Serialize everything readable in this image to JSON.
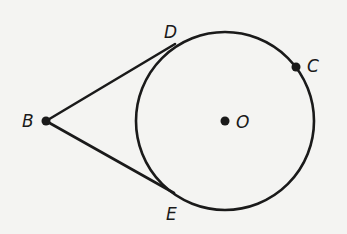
{
  "diagram": {
    "type": "geometry-tangents-to-circle",
    "colors": {
      "background": "#f4f4f2",
      "stroke": "#1a1a1a"
    },
    "circle": {
      "center_label": "O",
      "center": [
        225,
        121
      ],
      "radius": 89
    },
    "points": {
      "B": {
        "label": "B",
        "pos": [
          46,
          121
        ],
        "label_pos": [
          22,
          127
        ],
        "dot": true
      },
      "D": {
        "label": "D",
        "pos": [
          175,
          44
        ],
        "label_pos": [
          164,
          38
        ],
        "dot": false
      },
      "E": {
        "label": "E",
        "pos": [
          174,
          193
        ],
        "label_pos": [
          166,
          220
        ],
        "dot": false
      },
      "C": {
        "label": "C",
        "pos": [
          296,
          67
        ],
        "label_pos": [
          307,
          72
        ],
        "dot": true
      },
      "O": {
        "label": "O",
        "pos": [
          225,
          121
        ],
        "label_pos": [
          236,
          128
        ],
        "dot": true
      }
    },
    "segments": [
      {
        "from": "B",
        "to": "D",
        "name": "tangent-BD"
      },
      {
        "from": "B",
        "to": "E",
        "name": "tangent-BE"
      }
    ]
  }
}
